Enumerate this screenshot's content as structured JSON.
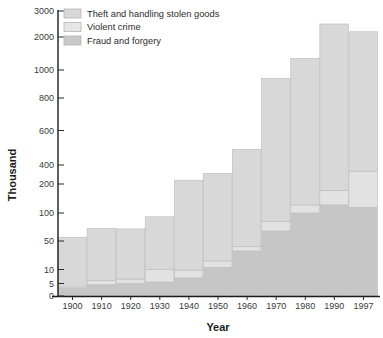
{
  "chart_data": {
    "type": "bar",
    "stacked": true,
    "title": "",
    "subtitle": "",
    "xlabel": "Year",
    "ylabel": "Thousand",
    "categories": [
      "1900",
      "1910",
      "1920",
      "1930",
      "1940",
      "1950",
      "1960",
      "1970",
      "1980",
      "1990",
      "1997"
    ],
    "series": [
      {
        "name": "Fraud and forgery",
        "color": "#c6c6c6",
        "values": [
          3,
          4.5,
          5,
          5.5,
          7,
          13,
          36,
          68,
          100,
          128,
          120
        ]
      },
      {
        "name": "Violent crime",
        "color": "#e2e2e2",
        "values": [
          0.6,
          1.6,
          1.6,
          4.7,
          2.8,
          9,
          6,
          17,
          28,
          50,
          215
        ]
      },
      {
        "name": "Theft and handling stolen goods",
        "color": "#d8d8d8",
        "values": [
          53,
          66,
          65,
          83,
          230,
          288,
          448,
          855,
          1222,
          2322,
          1865
        ]
      }
    ],
    "totals": [
      57,
      72,
      72,
      93,
      240,
      310,
      490,
      940,
      1350,
      2500,
      2200
    ],
    "yscale": "log-piecewise",
    "yticks": [
      0,
      5,
      10,
      50,
      100,
      200,
      400,
      600,
      800,
      1000,
      2000,
      3000
    ],
    "ytick_labels": [
      "0",
      "5",
      "10",
      "50",
      "100",
      "200",
      "400",
      "600",
      "800",
      "1000",
      "2000",
      "3000"
    ],
    "ylim": [
      0,
      3000
    ],
    "grid": false,
    "legend_position": "top-left"
  },
  "legend": {
    "entries": [
      {
        "label": "Theft and handling stolen goods",
        "swatch": "#d8d8d8"
      },
      {
        "label": "Violent crime",
        "swatch": "#e6e6e6"
      },
      {
        "label": "Fraud and forgery",
        "swatch": "#c9c9c9"
      }
    ]
  },
  "axes": {
    "y_title": "Thousand",
    "x_title": "Year"
  },
  "colors": {
    "background": "#ffffff",
    "axis": "#1c1c1c",
    "text": "#2b2b2b",
    "bar_border": "#bfbfbf"
  }
}
